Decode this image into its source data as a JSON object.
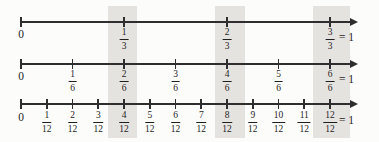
{
  "figure": {
    "background": "#fcfcfb",
    "line_color": "#2e2e2e",
    "text_color": "#1f1f1f"
  },
  "highlight": {
    "color": "#e5e3df",
    "top": 6,
    "bottom": 138,
    "bands": [
      {
        "x": 108,
        "width": 29
      },
      {
        "x": 215,
        "width": 30
      },
      {
        "x": 313,
        "width": 37
      }
    ],
    "equivalent_columns": [
      [
        "1/3",
        "2/6",
        "4/12"
      ],
      [
        "2/3",
        "4/6",
        "8/12"
      ],
      [
        "3/3",
        "6/6",
        "12/12"
      ]
    ]
  },
  "number_lines": [
    {
      "name": "thirds",
      "denominator": 3,
      "y": 22,
      "label_y": 28,
      "x_start": 21,
      "x_unit_end": 330,
      "arrow_tip_x": 358,
      "zero_label": "0",
      "labels": [
        {
          "num": "1",
          "den": "3",
          "highlighted": true
        },
        {
          "num": "2",
          "den": "3",
          "highlighted": true
        },
        {
          "num": "3",
          "den": "3",
          "highlighted": true,
          "suffix": "= 1"
        }
      ]
    },
    {
      "name": "sixths",
      "denominator": 6,
      "y": 64,
      "label_y": 70,
      "x_start": 21,
      "x_unit_end": 330,
      "arrow_tip_x": 358,
      "zero_label": "0",
      "labels": [
        {
          "num": "1",
          "den": "6",
          "highlighted": false
        },
        {
          "num": "2",
          "den": "6",
          "highlighted": true
        },
        {
          "num": "3",
          "den": "6",
          "highlighted": false
        },
        {
          "num": "4",
          "den": "6",
          "highlighted": true
        },
        {
          "num": "5",
          "den": "6",
          "highlighted": false
        },
        {
          "num": "6",
          "den": "6",
          "highlighted": true,
          "suffix": "= 1"
        }
      ]
    },
    {
      "name": "twelfths",
      "denominator": 12,
      "y": 104,
      "label_y": 111,
      "x_start": 21,
      "x_unit_end": 330,
      "arrow_tip_x": 358,
      "zero_label": "0",
      "labels": [
        {
          "num": "1",
          "den": "12",
          "highlighted": false
        },
        {
          "num": "2",
          "den": "12",
          "highlighted": false
        },
        {
          "num": "3",
          "den": "12",
          "highlighted": false
        },
        {
          "num": "4",
          "den": "12",
          "highlighted": true
        },
        {
          "num": "5",
          "den": "12",
          "highlighted": false
        },
        {
          "num": "6",
          "den": "12",
          "highlighted": false
        },
        {
          "num": "7",
          "den": "12",
          "highlighted": false
        },
        {
          "num": "8",
          "den": "12",
          "highlighted": true
        },
        {
          "num": "9",
          "den": "12",
          "highlighted": false
        },
        {
          "num": "10",
          "den": "12",
          "highlighted": false
        },
        {
          "num": "11",
          "den": "12",
          "highlighted": false
        },
        {
          "num": "12",
          "den": "12",
          "highlighted": true,
          "suffix": "= 1"
        }
      ]
    }
  ]
}
